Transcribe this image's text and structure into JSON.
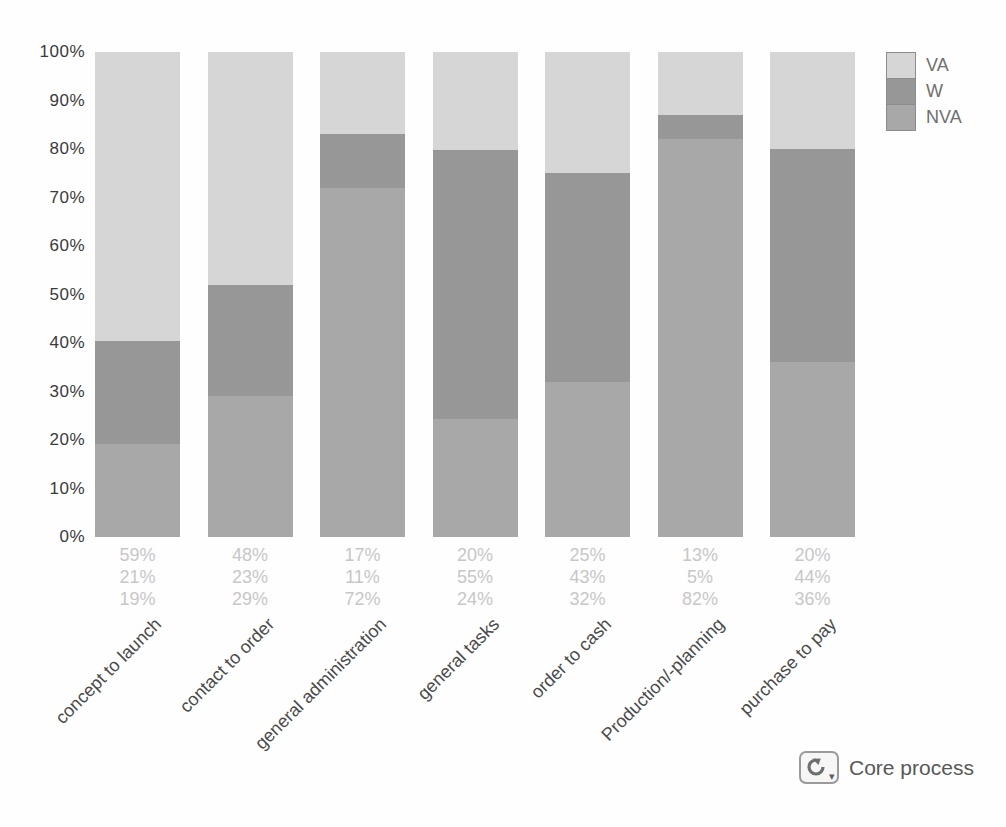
{
  "chart_data": {
    "type": "bar",
    "stacked": true,
    "orientation": "vertical",
    "title": "",
    "categories": [
      "concept to launch",
      "contact to order",
      "general administration",
      "general tasks",
      "order to cash",
      "Production/-planning",
      "purchase to pay"
    ],
    "series": [
      {
        "name": "VA",
        "color": "#d6d6d6",
        "values": [
          59,
          48,
          17,
          20,
          25,
          13,
          20
        ]
      },
      {
        "name": "W",
        "color": "#979797",
        "values": [
          21,
          23,
          11,
          55,
          43,
          5,
          44
        ]
      },
      {
        "name": "NVA",
        "color": "#a8a8a8",
        "values": [
          19,
          29,
          72,
          24,
          32,
          82,
          36
        ]
      }
    ],
    "stack_order_top_to_bottom": [
      "VA",
      "W",
      "NVA"
    ],
    "y_axis": {
      "min": 0,
      "max": 100,
      "ticks": [
        "100%",
        "90%",
        "80%",
        "70%",
        "60%",
        "50%",
        "40%",
        "30%",
        "20%",
        "10%",
        "0%"
      ]
    },
    "grid": false,
    "legend": {
      "position": "top-right",
      "entries": [
        "VA",
        "W",
        "NVA"
      ]
    },
    "value_label_suffix": "%",
    "value_label_color": "#c7c7c7"
  },
  "footer": {
    "core_process_label": "Core process",
    "core_process_icon": "refresh-dropdown-icon"
  }
}
